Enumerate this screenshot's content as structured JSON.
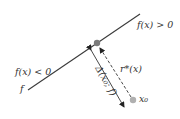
{
  "diagram": {
    "boundary_label": "f",
    "region_positive_label": "f(x) > 0",
    "region_negative_label": "f(x) < 0",
    "perturbation_label": "r*(x)",
    "distance_label": "Δ(x₀; f)",
    "point_label": "x₀",
    "colors": {
      "line": "#3a3a3a",
      "projection_point": "#7a7a7a",
      "data_point": "#b0b0b0",
      "text": "#333333"
    }
  }
}
